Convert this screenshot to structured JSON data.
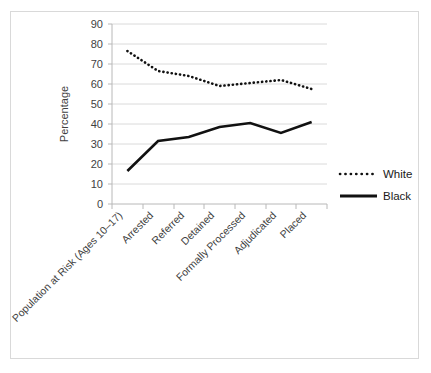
{
  "chart_data": {
    "type": "line",
    "title": "",
    "xlabel": "",
    "ylabel": "Percentage",
    "ylim": [
      0,
      90
    ],
    "ytick_step": 10,
    "yticks": [
      "0",
      "10",
      "20",
      "30",
      "40",
      "50",
      "60",
      "70",
      "80",
      "90"
    ],
    "grid": true,
    "legend_position": "right",
    "categories": [
      "Population at Risk (Ages 10–17)",
      "Arrested",
      "Referred",
      "Detained",
      "Formally Processed",
      "Adjudicated",
      "Placed"
    ],
    "series": [
      {
        "name": "White",
        "style": "dotted",
        "color": "#111111",
        "values": [
          76.5,
          66.5,
          64.0,
          59.0,
          60.5,
          62.0,
          57.5
        ]
      },
      {
        "name": "Black",
        "style": "solid",
        "color": "#111111",
        "values": [
          16.5,
          31.5,
          33.5,
          38.5,
          40.5,
          35.5,
          41.0
        ]
      }
    ]
  },
  "legend": {
    "entries": [
      {
        "label": "White"
      },
      {
        "label": "Black"
      }
    ]
  }
}
